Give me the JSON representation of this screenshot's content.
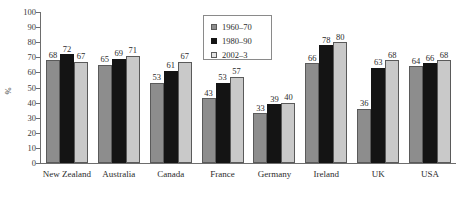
{
  "chart_data": {
    "type": "bar",
    "title": "",
    "subtitle": "",
    "xlabel": "",
    "ylabel": "%",
    "ylim": [
      0,
      100
    ],
    "ytick_step": 10,
    "yticks": [
      100,
      90,
      80,
      70,
      60,
      50,
      40,
      30,
      20,
      10,
      0
    ],
    "grid": false,
    "legend_position": "top-center",
    "categories": [
      "New Zealand",
      "Australia",
      "Canada",
      "France",
      "Germany",
      "Ireland",
      "UK",
      "USA"
    ],
    "series": [
      {
        "name": "1960–70",
        "color": "#8d8d8d",
        "values": [
          68,
          65,
          53,
          43,
          33,
          66,
          36,
          64
        ]
      },
      {
        "name": "1980–90",
        "color": "#141414",
        "values": [
          72,
          69,
          61,
          53,
          39,
          78,
          63,
          66
        ]
      },
      {
        "name": "2002–3",
        "color": "#c9c9c9",
        "values": [
          67,
          71,
          67,
          57,
          40,
          80,
          68,
          68
        ]
      }
    ]
  },
  "legend": {
    "entries": [
      "1960–70",
      "1980–90",
      "2002–3"
    ]
  },
  "axis": {
    "y_title": "%",
    "y_labels": [
      "100",
      "90",
      "80",
      "70",
      "60",
      "50",
      "40",
      "30",
      "20",
      "10",
      "0"
    ]
  },
  "colors": {
    "series_1": "#8d8d8d",
    "series_2": "#141414",
    "series_3": "#c9c9c9",
    "axis": "#6d6d6d",
    "text": "#2b2b2b",
    "background": "#ffffff"
  }
}
